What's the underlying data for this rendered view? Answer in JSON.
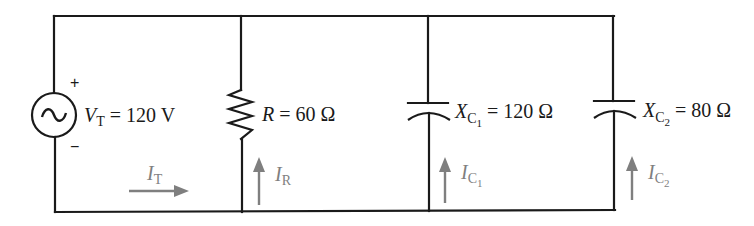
{
  "diagram": {
    "type": "parallel AC circuit",
    "colors": {
      "wire": "#1a1a1a",
      "current_arrow": "#7f7f7f"
    },
    "source": {
      "symbol": "~",
      "plus": "+",
      "minus": "−",
      "label_var": "V",
      "label_sub": "T",
      "label_value": " = 120 V"
    },
    "resistor": {
      "label_var": "R",
      "label_value": " = 60 Ω"
    },
    "capacitor1": {
      "label_var": "X",
      "label_sub": "C",
      "label_subsub": "1",
      "label_value": " = 120 Ω"
    },
    "capacitor2": {
      "label_var": "X",
      "label_sub": "C",
      "label_subsub": "2",
      "label_value": " = 80 Ω"
    },
    "currents": {
      "total": {
        "var": "I",
        "sub": "T",
        "direction": "right"
      },
      "resistor": {
        "var": "I",
        "sub": "R",
        "direction": "up"
      },
      "cap1": {
        "var": "I",
        "sub": "C",
        "subsub": "1",
        "direction": "up"
      },
      "cap2": {
        "var": "I",
        "sub": "C",
        "subsub": "2",
        "direction": "up"
      }
    }
  }
}
